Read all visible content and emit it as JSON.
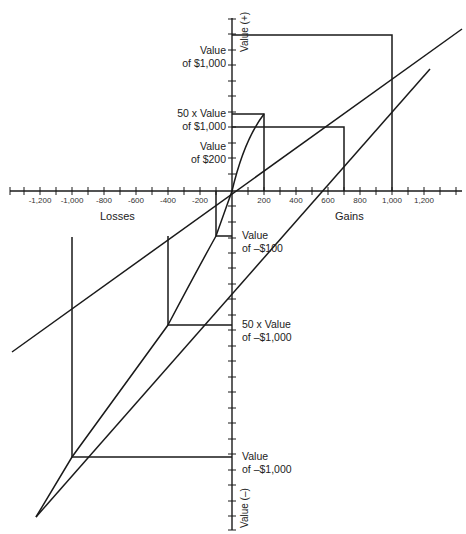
{
  "diagram": {
    "type": "value-function",
    "axes": {
      "x_ticks": [
        "-1,200",
        "-1,000",
        "-800",
        "-600",
        "-400",
        "-200",
        "200",
        "400",
        "600",
        "800",
        "1,000",
        "1,200"
      ],
      "x_left_title": "Losses",
      "x_right_title": "Gains",
      "y_top_title": "Value (+)",
      "y_bottom_title": "Value (–)"
    },
    "annotations": {
      "value_1000_line1": "Value",
      "value_1000_line2": "of $1,000",
      "fifty_value_1000_line1": "50 x Value",
      "fifty_value_1000_line2": "of $1,000",
      "value_200_line1": "Value",
      "value_200_line2": "of $200",
      "value_neg100_line1": "Value",
      "value_neg100_line2": "of –$100",
      "fifty_value_neg1000_line1": "50 x Value",
      "fifty_value_neg1000_line2": "of –$1,000",
      "value_neg1000_line1": "Value",
      "value_neg1000_line2": "of –$1,000"
    },
    "stroke_color": "#1a1a1a"
  }
}
